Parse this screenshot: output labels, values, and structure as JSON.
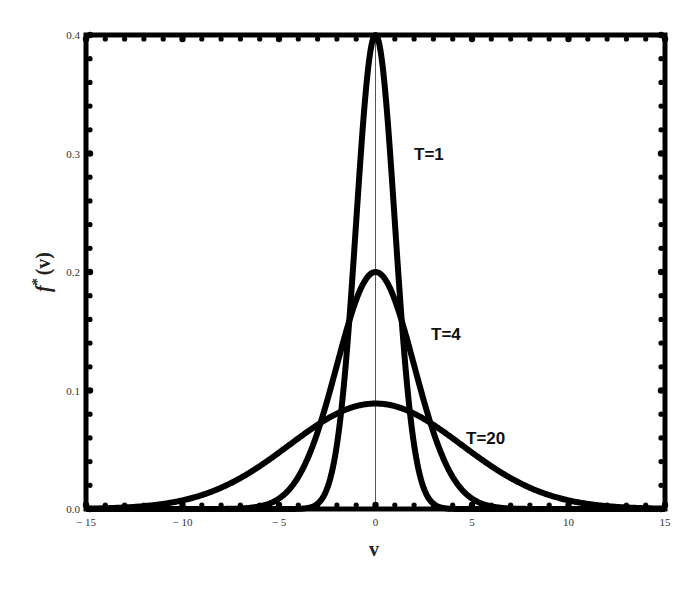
{
  "chart_data": {
    "type": "line",
    "title": "",
    "xlabel": "v",
    "ylabel": "f*(v)",
    "xlim": [
      -15,
      15
    ],
    "ylim": [
      0.0,
      0.4
    ],
    "x_ticks": [
      -15,
      -10,
      -5,
      0,
      5,
      10,
      15
    ],
    "x_tick_labels": [
      "-15",
      "-10",
      "-5",
      "0",
      "5",
      "10",
      "15"
    ],
    "y_ticks": [
      0.0,
      0.1,
      0.2,
      0.3,
      0.4
    ],
    "y_tick_labels": [
      "0.0",
      "0.1",
      "0.2",
      "0.3",
      "0.4"
    ],
    "grid": false,
    "legend": "none (inline curve labels)",
    "series": [
      {
        "name": "T=1",
        "shape": "gaussian",
        "mean": 0,
        "sigma": 1.0,
        "peak": 0.4,
        "x": [
          -4,
          -3,
          -2,
          -1,
          0,
          1,
          2,
          3,
          4
        ],
        "y": [
          0.0001,
          0.0044,
          0.054,
          0.242,
          0.399,
          0.242,
          0.054,
          0.0044,
          0.0001
        ]
      },
      {
        "name": "T=4",
        "shape": "gaussian",
        "mean": 0,
        "sigma": 2.0,
        "peak": 0.2,
        "x": [
          -8,
          -6,
          -4,
          -2,
          0,
          2,
          4,
          6,
          8
        ],
        "y": [
          0.0001,
          0.0022,
          0.027,
          0.121,
          0.199,
          0.121,
          0.027,
          0.0022,
          0.0001
        ]
      },
      {
        "name": "T=20",
        "shape": "gaussian",
        "mean": 0,
        "sigma": 4.47,
        "peak": 0.089,
        "x": [
          -15,
          -10,
          -5,
          0,
          5,
          10,
          15
        ],
        "y": [
          0.0003,
          0.0073,
          0.051,
          0.089,
          0.051,
          0.0073,
          0.0003
        ]
      }
    ],
    "annotations": [
      {
        "text": "T=1",
        "x": 2.8,
        "y": 0.3
      },
      {
        "text": "T=4",
        "x": 3.8,
        "y": 0.132
      },
      {
        "text": "T=20",
        "x": 6.2,
        "y": 0.059
      }
    ],
    "reference_lines": [
      {
        "orientation": "vertical",
        "x": 0
      }
    ]
  },
  "labels": {
    "xlabel": "v",
    "ylabel_f": "f",
    "ylabel_star": "*",
    "ylabel_arg": "(v)",
    "curve_T1": "T=1",
    "curve_T4": "T=4",
    "curve_T20": "T=20"
  }
}
